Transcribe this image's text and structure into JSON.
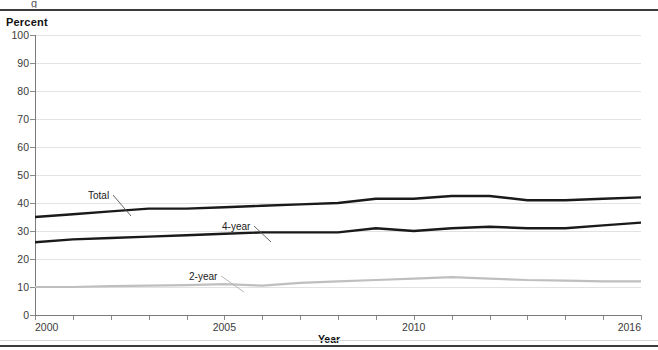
{
  "figure": {
    "clipped_glyph": "g",
    "y_axis_title": "Percent",
    "x_axis_title": "Year"
  },
  "chart_data": {
    "type": "line",
    "title": "",
    "xlabel": "Year",
    "ylabel": "Percent",
    "xlim": [
      2000,
      2016
    ],
    "ylim": [
      0,
      100
    ],
    "grid": true,
    "legend_position": "inline-annotations",
    "y_ticks": [
      0,
      10,
      20,
      30,
      40,
      50,
      60,
      70,
      80,
      90,
      100
    ],
    "x_ticks": [
      2000,
      2001,
      2002,
      2003,
      2004,
      2005,
      2006,
      2007,
      2008,
      2009,
      2010,
      2011,
      2012,
      2013,
      2014,
      2015,
      2016
    ],
    "x_tick_labels": [
      "2000",
      "",
      "",
      "",
      "",
      "2005",
      "",
      "",
      "",
      "",
      "2010",
      "",
      "",
      "",
      "",
      "",
      "2016"
    ],
    "x": [
      2000,
      2001,
      2002,
      2003,
      2004,
      2005,
      2006,
      2007,
      2008,
      2009,
      2010,
      2011,
      2012,
      2013,
      2014,
      2015,
      2016
    ],
    "series": [
      {
        "name": "Total",
        "color": "#1a1a1a",
        "label_text": "Total",
        "values": [
          35,
          36,
          37,
          38,
          38,
          38.5,
          39,
          39.5,
          40,
          41.5,
          41.5,
          42.5,
          42.5,
          41,
          41,
          41.5,
          42
        ]
      },
      {
        "name": "4-year",
        "color": "#1a1a1a",
        "label_text": "4-year",
        "values": [
          26,
          27,
          27.5,
          28,
          28.5,
          29,
          29.5,
          29.5,
          29.5,
          31,
          30,
          31,
          31.5,
          31,
          31,
          32,
          33
        ]
      },
      {
        "name": "2-year",
        "color": "#bfbfbf",
        "label_text": "2-year",
        "values": [
          10,
          10,
          10.3,
          10.5,
          10.7,
          11,
          10.5,
          11.5,
          12,
          12.5,
          13,
          13.5,
          13,
          12.5,
          12.3,
          12,
          12
        ]
      }
    ],
    "annotations": [
      {
        "text": "Total",
        "x_px": 88,
        "y_px": 190,
        "leader_to_x": 130,
        "leader_to_y": 215
      },
      {
        "text": "4-year",
        "x_px": 222,
        "y_px": 221,
        "leader_to_x": 270,
        "leader_to_y": 241
      },
      {
        "text": "2-year",
        "x_px": 189,
        "y_px": 271,
        "leader_to_x": 243,
        "leader_to_y": 291
      }
    ]
  }
}
